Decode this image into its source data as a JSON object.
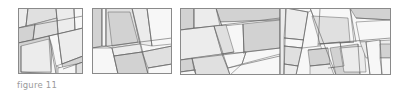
{
  "caption": "figure 11",
  "colors": {
    "stroke": "#5f5f5f",
    "frame": "#8a8a8a",
    "light": "#f7f7f7",
    "pale": "#ececec",
    "mid": "#e0e0e0",
    "dark": "#d2d2d2"
  },
  "panels": [
    {
      "name": "panel-1",
      "x": 18,
      "y": 8,
      "w": 65,
      "h": 66,
      "polys": [
        {
          "pts": "0,0 10,0 8,18 0,20",
          "fill": "pale"
        },
        {
          "pts": "10,0 38,0 39,10 8,18",
          "fill": "mid"
        },
        {
          "pts": "38,0 56,0 57,22 40,26 39,10",
          "fill": "pale"
        },
        {
          "pts": "56,0 65,0 65,20 57,22",
          "fill": "light"
        },
        {
          "pts": "0,20 17,16 15,32 0,35",
          "fill": "dark"
        },
        {
          "pts": "17,16 39,10 40,26 31,28 15,32",
          "fill": "mid"
        },
        {
          "pts": "0,35 15,32 31,28 34,38 33,66 0,66",
          "fill": "dark"
        },
        {
          "pts": "3,38 31,31 33,64 3,64",
          "fill": "pale"
        },
        {
          "pts": "31,28 40,26 44,56 38,58 34,38",
          "fill": "light"
        },
        {
          "pts": "40,26 57,22 65,20 65,48 44,56",
          "fill": "pale"
        },
        {
          "pts": "44,56 65,48 65,54 45,61",
          "fill": "dark"
        },
        {
          "pts": "38,58 45,61 65,54 65,66 38,66",
          "fill": "mid"
        },
        {
          "pts": "40,60 58,56 58,66 40,66",
          "fill": "light"
        }
      ],
      "lines": [
        "0,20 65,8",
        "10,0 8,18",
        "38,0 40,26",
        "56,0 57,22",
        "0,35 65,20",
        "17,16 15,32",
        "31,28 38,66",
        "40,26 44,56",
        "44,56 65,48",
        "45,61 65,54",
        "3,38 3,64",
        "3,64 38,66",
        "58,56 58,66"
      ]
    },
    {
      "name": "panel-2",
      "x": 92,
      "y": 8,
      "w": 80,
      "h": 66,
      "polys": [
        {
          "pts": "0,0 10,0 10,38 0,40",
          "fill": "dark"
        },
        {
          "pts": "10,0 14,0 14,38 10,38",
          "fill": "light"
        },
        {
          "pts": "14,0 40,0 48,36 20,40 14,38",
          "fill": "mid"
        },
        {
          "pts": "16,4 38,4 46,34 20,38",
          "fill": "dark"
        },
        {
          "pts": "40,0 55,0 60,38 48,36",
          "fill": "pale"
        },
        {
          "pts": "55,0 80,0 80,36 60,38",
          "fill": "light"
        },
        {
          "pts": "0,40 20,40 26,66 0,66",
          "fill": "light"
        },
        {
          "pts": "20,40 48,36 50,44 22,48",
          "fill": "pale"
        },
        {
          "pts": "22,48 50,44 56,66 26,66",
          "fill": "dark"
        },
        {
          "pts": "50,44 80,38 80,56 56,60",
          "fill": "mid"
        },
        {
          "pts": "56,60 80,56 80,66 56,66",
          "fill": "light"
        }
      ],
      "lines": [
        "10,0 10,38",
        "14,0 14,38",
        "0,40 80,30",
        "40,0 56,66",
        "55,0 60,38",
        "20,40 26,66",
        "22,48 50,44",
        "56,60 80,56",
        "50,44 80,38"
      ]
    },
    {
      "name": "panel-3",
      "x": 180,
      "y": 8,
      "w": 211,
      "h": 67,
      "polys": [
        {
          "pts": "0,0 14,0 14,20 0,22",
          "fill": "dark"
        },
        {
          "pts": "14,0 36,0 40,18 14,20",
          "fill": "pale"
        },
        {
          "pts": "36,0 100,0 100,12 40,14",
          "fill": "dark"
        },
        {
          "pts": "40,14 100,12 100,16 42,18",
          "fill": "light"
        },
        {
          "pts": "42,18 63,16 64,46 46,48",
          "fill": "light"
        },
        {
          "pts": "63,16 100,12 100,40 64,44",
          "fill": "dark"
        },
        {
          "pts": "0,22 34,18 42,46 0,52",
          "fill": "pale"
        },
        {
          "pts": "34,18 46,17 54,44 42,46",
          "fill": "mid"
        },
        {
          "pts": "0,52 12,50 14,62 0,64",
          "fill": "dark"
        },
        {
          "pts": "0,64 14,62 16,67 0,67",
          "fill": "light"
        },
        {
          "pts": "12,50 42,46 50,67 16,67",
          "fill": "mid"
        },
        {
          "pts": "42,46 66,44 62,56 48,60",
          "fill": "light"
        },
        {
          "pts": "62,56 100,46 100,67 50,67",
          "fill": "light"
        },
        {
          "pts": "100,0 106,0 104,67 100,67",
          "fill": "pale"
        },
        {
          "pts": "106,0 128,4 124,32 104,30",
          "fill": "pale"
        },
        {
          "pts": "104,30 124,32 122,40 104,38",
          "fill": "light"
        },
        {
          "pts": "104,38 122,40 118,58 104,56",
          "fill": "mid"
        },
        {
          "pts": "104,56 118,58 116,67 104,67",
          "fill": "pale"
        },
        {
          "pts": "128,4 138,0 140,38 122,40",
          "fill": "light"
        },
        {
          "pts": "130,0 170,0 174,34 144,36",
          "fill": "light"
        },
        {
          "pts": "132,8 168,10 170,34 140,36",
          "fill": "mid"
        },
        {
          "pts": "140,36 160,34 164,58 148,60",
          "fill": "light"
        },
        {
          "pts": "128,42 148,40 150,56 130,58",
          "fill": "dark"
        },
        {
          "pts": "130,58 150,56 154,67 130,67",
          "fill": "pale"
        },
        {
          "pts": "150,40 178,36 180,67 156,67",
          "fill": "dark"
        },
        {
          "pts": "160,40 184,38 186,64 164,64",
          "fill": "pale"
        },
        {
          "pts": "170,0 211,0 211,12 176,10",
          "fill": "dark"
        },
        {
          "pts": "176,14 211,12 211,34 180,34",
          "fill": "light"
        },
        {
          "pts": "180,34 211,32 211,48 186,50",
          "fill": "pale"
        },
        {
          "pts": "186,34 200,32 202,67 190,67",
          "fill": "light"
        },
        {
          "pts": "200,36 211,36 211,50 200,50",
          "fill": "dark"
        },
        {
          "pts": "200,50 211,50 211,67 202,67",
          "fill": "light"
        }
      ],
      "lines": [
        "14,0 14,20",
        "0,22 100,10",
        "36,0 42,18",
        "63,16 64,46",
        "34,18 50,67",
        "0,52 100,40",
        "12,50 16,67",
        "48,60 100,48",
        "62,56 66,44",
        "100,0 100,67",
        "106,0 104,67",
        "106,0 128,4",
        "104,30 124,32",
        "104,38 122,40",
        "104,56 118,58",
        "128,4 122,40",
        "122,40 116,67",
        "130,0 156,67",
        "138,36 211,30",
        "140,36 174,34",
        "148,60 164,58",
        "160,34 164,58",
        "170,0 176,34",
        "176,10 211,12",
        "186,34 190,67",
        "200,32 202,67",
        "178,36 180,67",
        "130,58 150,56",
        "128,42 148,40",
        "140,0 138,38",
        "0,64 16,62",
        "42,46 54,44"
      ]
    }
  ]
}
